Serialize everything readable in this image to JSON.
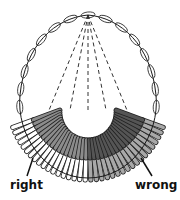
{
  "labels": {
    "right": "right",
    "wrong": "wrong"
  },
  "colors": {
    "outline": "#1a1a1a",
    "right_inner": "#8c8c8c",
    "right_outer": "#ffffff",
    "wrong_inner": "#555555",
    "wrong_outer": "#a8a8a8",
    "background": "#ffffff"
  },
  "geometry": {
    "apex": [
      88,
      15
    ],
    "center": [
      88,
      100
    ],
    "bar_inner_radius": 30,
    "bar_outer_radius": 80,
    "bar_split_radius": 58,
    "bar_count_right": 18,
    "bar_count_wrong": 18,
    "angle_start_deg": 160,
    "angle_end_deg": 20,
    "dashed_lines_to": [
      [
        45,
        120
      ],
      [
        70,
        110
      ],
      [
        88,
        110
      ],
      [
        106,
        110
      ],
      [
        131,
        120
      ]
    ]
  }
}
